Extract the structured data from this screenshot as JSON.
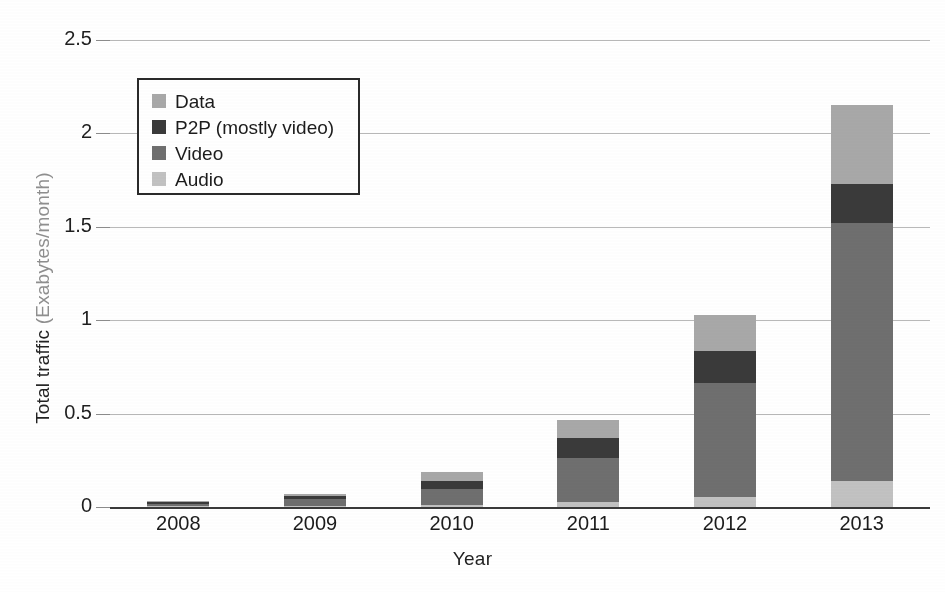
{
  "chart_data": {
    "type": "bar",
    "stacked": true,
    "title": "",
    "xlabel": "Year",
    "ylabel": "Total traffic (Exabytes/month)",
    "categories": [
      "2008",
      "2009",
      "2010",
      "2011",
      "2012",
      "2013"
    ],
    "ylim": [
      0,
      2.5
    ],
    "yticks": [
      "0",
      "0.5",
      "1",
      "1.5",
      "2",
      "2.5"
    ],
    "ytick_values": [
      0,
      0.5,
      1,
      1.5,
      2,
      2.5
    ],
    "grid": true,
    "legend_position": "upper-left-inside",
    "stack_order_bottom_to_top": [
      "Audio",
      "Video",
      "P2P (mostly video)",
      "Data"
    ],
    "series": [
      {
        "name": "Audio",
        "values": [
          0.004,
          0.008,
          0.012,
          0.025,
          0.055,
          0.14
        ]
      },
      {
        "name": "Video",
        "values": [
          0.012,
          0.035,
          0.085,
          0.24,
          0.61,
          1.38
        ]
      },
      {
        "name": "P2P (mostly video)",
        "values": [
          0.008,
          0.016,
          0.042,
          0.105,
          0.17,
          0.21
        ]
      },
      {
        "name": "Data",
        "values": [
          0.006,
          0.011,
          0.048,
          0.095,
          0.195,
          0.42
        ]
      }
    ],
    "totals": [
      0.03,
      0.07,
      0.187,
      0.465,
      1.03,
      2.15
    ],
    "colors": {
      "Data": "#a8a8a8",
      "P2P (mostly video)": "#3a3a3a",
      "Video": "#6f6f6f",
      "Audio": "#c2c2c2"
    }
  },
  "legend": {
    "items": [
      {
        "label": "Data",
        "color": "#a8a8a8"
      },
      {
        "label": "P2P (mostly video)",
        "color": "#3a3a3a"
      },
      {
        "label": "Video",
        "color": "#6f6f6f"
      },
      {
        "label": "Audio",
        "color": "#c2c2c2"
      }
    ]
  },
  "axes": {
    "y_title_main": "Total traffic ",
    "y_title_paren": "(Exabytes/month)",
    "x_title": "Year",
    "y_ticks": [
      "2.5",
      "2",
      "1.5",
      "1",
      "0.5",
      "0"
    ],
    "x_ticks": [
      "2008",
      "2009",
      "2010",
      "2011",
      "2012",
      "2013"
    ]
  }
}
